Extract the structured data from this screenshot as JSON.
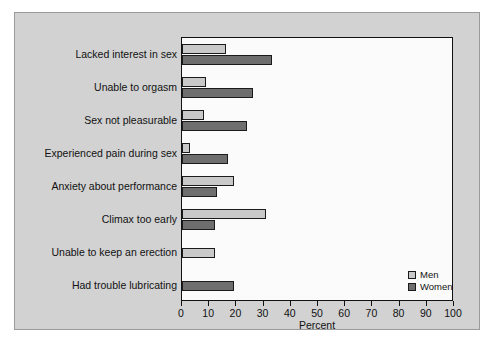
{
  "chart_data": {
    "type": "bar",
    "orientation": "horizontal",
    "title": "",
    "xlabel": "Percent",
    "ylabel": "",
    "xlim": [
      0,
      100
    ],
    "xticks": [
      0,
      10,
      20,
      30,
      40,
      50,
      60,
      70,
      80,
      90,
      100
    ],
    "grid": false,
    "legend_position": "inside-bottom-right",
    "categories": [
      "Lacked interest in sex",
      "Unable to orgasm",
      "Sex not pleasurable",
      "Experienced pain during sex",
      "Anxiety about performance",
      "Climax too early",
      "Unable to keep an erection",
      "Had trouble lubricating"
    ],
    "series": [
      {
        "name": "Men",
        "color": "#c9c9c9",
        "values": [
          16,
          9,
          8,
          3,
          19,
          31,
          12,
          null
        ]
      },
      {
        "name": "Women",
        "color": "#6e6e6e",
        "values": [
          33,
          26,
          24,
          17,
          13,
          12,
          null,
          19
        ]
      }
    ]
  },
  "legend": {
    "items": [
      {
        "label": "Men",
        "swatch": "men"
      },
      {
        "label": "Women",
        "swatch": "women"
      }
    ]
  },
  "axis": {
    "x_title": "Percent",
    "tick_labels": [
      "0",
      "10",
      "20",
      "30",
      "40",
      "50",
      "60",
      "70",
      "80",
      "90",
      "100"
    ]
  },
  "colors": {
    "panel_background": "#d2d2d2",
    "plot_background": "#fbfbfb",
    "men_bar": "#c9c9c9",
    "women_bar": "#6e6e6e",
    "axis_line": "#111111"
  }
}
